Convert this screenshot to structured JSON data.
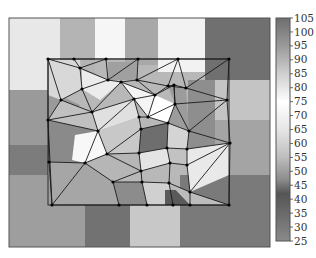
{
  "chart_data": {
    "type": "heatmap",
    "title": "",
    "xlabel": "",
    "ylabel": "",
    "colorbar": {
      "min": 25,
      "max": 105,
      "ticks": [
        105,
        100,
        95,
        90,
        85,
        80,
        75,
        70,
        65,
        60,
        55,
        50,
        45,
        40,
        35,
        30,
        25
      ],
      "stops": [
        {
          "value": 105,
          "color": "#6e6e6e"
        },
        {
          "value": 95,
          "color": "#9a9a9a"
        },
        {
          "value": 85,
          "color": "#cfcfcf"
        },
        {
          "value": 75,
          "color": "#ffffff"
        },
        {
          "value": 65,
          "color": "#e6e6e6"
        },
        {
          "value": 55,
          "color": "#bdbdbd"
        },
        {
          "value": 47,
          "color": "#8c8c8c"
        },
        {
          "value": 42,
          "color": "#555555"
        },
        {
          "value": 35,
          "color": "#6a6a6a"
        },
        {
          "value": 25,
          "color": "#8a8a8a"
        }
      ]
    },
    "cells": [
      {
        "points": "9,18 60,18 60,90 9,90",
        "color": "#e8e8e8"
      },
      {
        "points": "60,18 95,18 95,75 60,75",
        "color": "#b4b4b4"
      },
      {
        "points": "95,18 125,18 125,60 95,60",
        "color": "#f6f6f6"
      },
      {
        "points": "125,18 158,18 158,65 125,65",
        "color": "#a8a8a8"
      },
      {
        "points": "158,18 205,18 205,72 158,72",
        "color": "#f2f2f2"
      },
      {
        "points": "205,18 270,18 270,80 205,80",
        "color": "#707070"
      },
      {
        "points": "9,90 48,90 80,105 48,145 9,145",
        "color": "#9a9a9a"
      },
      {
        "points": "9,145 48,145 48,175 9,175",
        "color": "#7c7c7c"
      },
      {
        "points": "9,175 85,175 85,247 9,247",
        "color": "#9e9e9e"
      },
      {
        "points": "85,205 130,205 130,247 85,247",
        "color": "#727272"
      },
      {
        "points": "130,205 180,205 180,247 130,247",
        "color": "#c8c8c8"
      },
      {
        "points": "180,175 270,175 270,247 180,247",
        "color": "#7a7a7a"
      },
      {
        "points": "215,80 270,80 270,120 215,120",
        "color": "#c4c4c4"
      },
      {
        "points": "215,120 270,120 270,175 215,175",
        "color": "#a4a4a4"
      },
      {
        "points": "188,80 215,80 215,175 188,175",
        "color": "#8e8e8e"
      },
      {
        "points": "48,60 80,60 82,89 61,100 48,95",
        "color": "#d8d8d8"
      },
      {
        "points": "82,70 108,80 121,82 100,100 82,89",
        "color": "#ececec"
      },
      {
        "points": "108,62 137,62 137,80 108,80",
        "color": "#a0a0a0"
      },
      {
        "points": "121,82 155,95 148,117 134,99",
        "color": "#f4f4f4"
      },
      {
        "points": "61,100 92,112 98,131 70,135 48,120",
        "color": "#c0c0c0"
      },
      {
        "points": "92,112 134,99 139,117 98,131",
        "color": "#e0e0e0"
      },
      {
        "points": "155,95 175,104 168,123 148,117",
        "color": "#ffffff"
      },
      {
        "points": "168,86 186,88 189,131 168,123 175,104",
        "color": "#9c9c9c"
      },
      {
        "points": "48,120 98,131 85,163 49,162",
        "color": "#8a8a8a"
      },
      {
        "points": "98,131 139,117 141,129 139,153 107,154",
        "color": "#c8c8c8"
      },
      {
        "points": "141,129 168,123 167,148 139,153",
        "color": "#6e6e6e"
      },
      {
        "points": "168,123 189,131 187,149 167,148",
        "color": "#d4d4d4"
      },
      {
        "points": "75,135 98,131 107,154 85,163 72,160",
        "color": "#f8f8f8"
      },
      {
        "points": "107,154 139,153 141,171 113,182 85,163",
        "color": "#b6b6b6"
      },
      {
        "points": "139,153 167,148 170,163 141,171",
        "color": "#e4e4e4"
      },
      {
        "points": "167,148 187,149 187,165 170,163",
        "color": "#c2c2c2"
      },
      {
        "points": "187,149 230,143 229,175 190,192 187,165",
        "color": "#e9e9e9"
      },
      {
        "points": "49,162 85,163 113,182 119,205 52,205",
        "color": "#a6a6a6"
      },
      {
        "points": "113,182 142,182 147,205 119,205",
        "color": "#8c8c8c"
      },
      {
        "points": "142,182 169,183 173,205 147,205",
        "color": "#d0d0d0"
      },
      {
        "points": "165,190 185,190 190,205 165,205",
        "color": "#5a5a5a"
      },
      {
        "points": "169,183 190,192 229,205 190,205",
        "color": "#bcbcbc"
      }
    ],
    "nodes": [
      [
        48,
        59
      ],
      [
        74,
        59
      ],
      [
        106,
        59
      ],
      [
        138,
        59
      ],
      [
        178,
        59
      ],
      [
        229,
        59
      ],
      [
        80,
        68
      ],
      [
        108,
        80
      ],
      [
        137,
        80
      ],
      [
        168,
        86
      ],
      [
        186,
        88
      ],
      [
        82,
        89
      ],
      [
        121,
        82
      ],
      [
        155,
        95
      ],
      [
        174,
        85
      ],
      [
        61,
        100
      ],
      [
        92,
        112
      ],
      [
        134,
        99
      ],
      [
        148,
        117
      ],
      [
        175,
        104
      ],
      [
        227,
        100
      ],
      [
        48,
        120
      ],
      [
        139,
        117
      ],
      [
        98,
        131
      ],
      [
        141,
        129
      ],
      [
        168,
        123
      ],
      [
        189,
        131
      ],
      [
        230,
        143
      ],
      [
        107,
        154
      ],
      [
        139,
        153
      ],
      [
        167,
        148
      ],
      [
        187,
        149
      ],
      [
        49,
        162
      ],
      [
        85,
        163
      ],
      [
        170,
        163
      ],
      [
        187,
        165
      ],
      [
        141,
        171
      ],
      [
        113,
        182
      ],
      [
        142,
        182
      ],
      [
        169,
        183
      ],
      [
        190,
        192
      ],
      [
        52,
        205
      ],
      [
        119,
        205
      ],
      [
        147,
        205
      ],
      [
        173,
        205
      ],
      [
        190,
        205
      ],
      [
        229,
        205
      ]
    ],
    "edges": [
      [
        0,
        1
      ],
      [
        1,
        2
      ],
      [
        2,
        3
      ],
      [
        3,
        4
      ],
      [
        4,
        5
      ],
      [
        0,
        6
      ],
      [
        1,
        6
      ],
      [
        6,
        2
      ],
      [
        2,
        7
      ],
      [
        6,
        7
      ],
      [
        7,
        3
      ],
      [
        3,
        8
      ],
      [
        8,
        4
      ],
      [
        4,
        9
      ],
      [
        9,
        10
      ],
      [
        4,
        10
      ],
      [
        10,
        5
      ],
      [
        8,
        9
      ],
      [
        0,
        15
      ],
      [
        0,
        21
      ],
      [
        6,
        11
      ],
      [
        11,
        15
      ],
      [
        11,
        7
      ],
      [
        7,
        12
      ],
      [
        12,
        8
      ],
      [
        12,
        17
      ],
      [
        8,
        13
      ],
      [
        13,
        9
      ],
      [
        9,
        14
      ],
      [
        14,
        10
      ],
      [
        10,
        20
      ],
      [
        5,
        20
      ],
      [
        13,
        14
      ],
      [
        12,
        13
      ],
      [
        14,
        19
      ],
      [
        15,
        21
      ],
      [
        15,
        16
      ],
      [
        11,
        16
      ],
      [
        16,
        12
      ],
      [
        16,
        17
      ],
      [
        17,
        13
      ],
      [
        13,
        18
      ],
      [
        17,
        18
      ],
      [
        18,
        19
      ],
      [
        19,
        14
      ],
      [
        19,
        20
      ],
      [
        19,
        26
      ],
      [
        20,
        26
      ],
      [
        20,
        27
      ],
      [
        21,
        16
      ],
      [
        21,
        23
      ],
      [
        16,
        23
      ],
      [
        23,
        17
      ],
      [
        17,
        22
      ],
      [
        22,
        18
      ],
      [
        22,
        24
      ],
      [
        18,
        25
      ],
      [
        24,
        25
      ],
      [
        25,
        19
      ],
      [
        25,
        26
      ],
      [
        26,
        27
      ],
      [
        21,
        32
      ],
      [
        23,
        28
      ],
      [
        24,
        28
      ],
      [
        24,
        29
      ],
      [
        25,
        30
      ],
      [
        29,
        30
      ],
      [
        30,
        31
      ],
      [
        26,
        31
      ],
      [
        31,
        27
      ],
      [
        28,
        29
      ],
      [
        32,
        33
      ],
      [
        23,
        33
      ],
      [
        33,
        28
      ],
      [
        28,
        36
      ],
      [
        29,
        36
      ],
      [
        30,
        34
      ],
      [
        36,
        34
      ],
      [
        34,
        35
      ],
      [
        31,
        35
      ],
      [
        35,
        27
      ],
      [
        27,
        40
      ],
      [
        35,
        40
      ],
      [
        32,
        41
      ],
      [
        33,
        41
      ],
      [
        33,
        37
      ],
      [
        37,
        36
      ],
      [
        37,
        38
      ],
      [
        36,
        38
      ],
      [
        38,
        39
      ],
      [
        34,
        39
      ],
      [
        39,
        40
      ],
      [
        41,
        42
      ],
      [
        37,
        42
      ],
      [
        42,
        43
      ],
      [
        38,
        43
      ],
      [
        43,
        44
      ],
      [
        39,
        44
      ],
      [
        44,
        45
      ],
      [
        40,
        45
      ],
      [
        45,
        46
      ],
      [
        40,
        46
      ],
      [
        27,
        46
      ],
      [
        21,
        41
      ]
    ],
    "frame": {
      "x": 9,
      "y": 18,
      "width": 261,
      "height": 229
    },
    "mesh_frame": {
      "x": 48,
      "y": 59,
      "width": 181,
      "height": 146
    }
  }
}
